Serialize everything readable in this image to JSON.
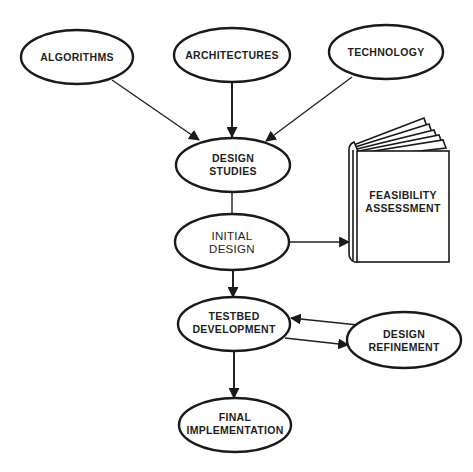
{
  "diagram": {
    "nodes": {
      "algorithms": {
        "label": "ALGORITHMS"
      },
      "architectures": {
        "label": "ARCHITECTURES"
      },
      "technology": {
        "label": "TECHNOLOGY"
      },
      "design_studies": {
        "line1": "DESIGN",
        "line2": "STUDIES"
      },
      "initial_design": {
        "line1": "INITIAL",
        "line2": "DESIGN"
      },
      "feasibility_assessment": {
        "line1": "FEASIBILITY",
        "line2": "ASSESSMENT",
        "shape": "book-icon"
      },
      "testbed_development": {
        "line1": "TESTBED",
        "line2": "DEVELOPMENT"
      },
      "design_refinement": {
        "line1": "DESIGN",
        "line2": "REFINEMENT"
      },
      "final_implementation": {
        "line1": "FINAL",
        "line2": "IMPLEMENTATION"
      }
    },
    "edges": [
      {
        "from": "ALGORITHMS",
        "to": "DESIGN STUDIES"
      },
      {
        "from": "ARCHITECTURES",
        "to": "DESIGN STUDIES"
      },
      {
        "from": "TECHNOLOGY",
        "to": "DESIGN STUDIES"
      },
      {
        "from": "DESIGN STUDIES",
        "to": "INITIAL DESIGN",
        "arrow": false
      },
      {
        "from": "INITIAL DESIGN",
        "to": "FEASIBILITY ASSESSMENT"
      },
      {
        "from": "INITIAL DESIGN",
        "to": "TESTBED DEVELOPMENT"
      },
      {
        "from": "TESTBED DEVELOPMENT",
        "to": "DESIGN REFINEMENT"
      },
      {
        "from": "DESIGN REFINEMENT",
        "to": "TESTBED DEVELOPMENT"
      },
      {
        "from": "TESTBED DEVELOPMENT",
        "to": "FINAL IMPLEMENTATION"
      }
    ],
    "colors": {
      "stroke": "#1a1a1a",
      "background": "#ffffff"
    }
  }
}
